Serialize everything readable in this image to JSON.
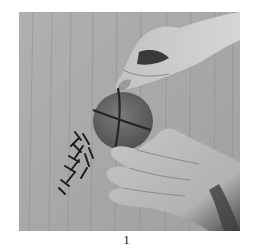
{
  "figure": {
    "caption": "1",
    "photo": {
      "description": "Grayscale photo: two hands pressing cloves in a cross pattern into a round fruit on a wooden surface, with a small pile of cloves at left",
      "tones": {
        "wood": "#a9a9a9",
        "wood_grain": "#8f8f8f",
        "skin_light": "#cfcfcf",
        "skin_mid": "#b4b4b4",
        "skin_shadow": "#6a6a6a",
        "fruit": "#6e6e6e",
        "fruit_dark": "#555555",
        "clove_line": "#262626",
        "cloves": "#1e1e1e"
      }
    }
  }
}
